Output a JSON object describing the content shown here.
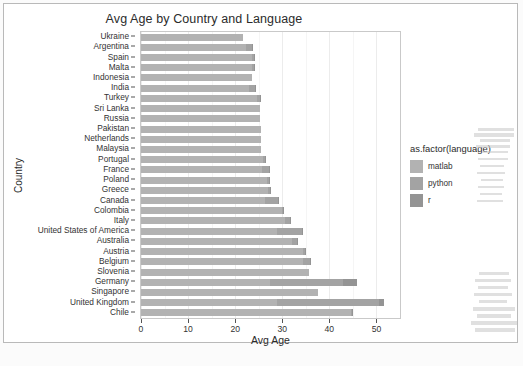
{
  "chart_data": {
    "type": "bar",
    "orientation": "horizontal",
    "stacked": true,
    "title": "Avg Age by Country and Language",
    "xlabel": "Avg Age",
    "ylabel": "Country",
    "xlim": [
      0,
      55
    ],
    "xticks": [
      0,
      10,
      20,
      30,
      40,
      50
    ],
    "xtick_labels": [
      "0",
      "10",
      "20",
      "30",
      "40",
      "50"
    ],
    "grid": true,
    "legend_title": "as.factor(language)",
    "legend_position": "right",
    "categories": [
      "Ukraine",
      "Argentina",
      "Spain",
      "Malta",
      "Indonesia",
      "India",
      "Turkey",
      "Sri Lanka",
      "Russia",
      "Pakistan",
      "Netherlands",
      "Malaysia",
      "Portugal",
      "France",
      "Poland",
      "Greece",
      "Canada",
      "Colombia",
      "Italy",
      "United States of America",
      "Australia",
      "Austria",
      "Belgium",
      "Slovenia",
      "Germany",
      "Singapore",
      "United Kingdom",
      "Chile"
    ],
    "series": [
      {
        "name": "matlab",
        "color": "#b2b2b2",
        "values": [
          21.6,
          22.2,
          23.5,
          23.5,
          23.6,
          23.0,
          24.6,
          25.3,
          25.3,
          25.4,
          25.5,
          25.4,
          26.0,
          25.6,
          26.8,
          27.0,
          26.4,
          29.9,
          30.5,
          28.9,
          32.0,
          34.4,
          34.4,
          35.6,
          27.4,
          37.6,
          28.8,
          44.6
        ]
      },
      {
        "name": "python",
        "color": "#a3a3a3",
        "values": [
          0.0,
          1.4,
          0.6,
          0.4,
          0.0,
          1.2,
          0.6,
          0.0,
          0.0,
          0.0,
          0.0,
          0.0,
          0.4,
          1.6,
          0.3,
          0.4,
          2.8,
          0.3,
          1.1,
          5.2,
          1.2,
          0.4,
          1.4,
          0.0,
          15.6,
          0.0,
          21.8,
          0.3
        ]
      },
      {
        "name": "r",
        "color": "#949494",
        "values": [
          0.0,
          0.1,
          0.1,
          0.1,
          0.0,
          0.1,
          0.1,
          0.0,
          0.0,
          0.0,
          0.0,
          0.0,
          0.1,
          0.1,
          0.1,
          0.1,
          0.1,
          0.1,
          0.1,
          0.1,
          0.1,
          0.1,
          0.1,
          0.0,
          2.8,
          0.0,
          1.1,
          0.1
        ]
      }
    ],
    "totals": [
      21.6,
      23.7,
      24.2,
      24.0,
      23.6,
      24.3,
      25.3,
      25.3,
      25.3,
      25.4,
      25.5,
      25.4,
      26.5,
      27.3,
      27.2,
      27.5,
      29.3,
      30.3,
      31.7,
      34.2,
      33.3,
      34.9,
      35.9,
      35.6,
      45.8,
      37.6,
      51.7,
      45.0
    ]
  },
  "legend": {
    "title": "as.factor(language)",
    "entries": [
      {
        "label": "matlab",
        "key": "matlab-swatch"
      },
      {
        "label": "python",
        "key": "python-swatch"
      },
      {
        "label": "r",
        "key": "r-swatch"
      }
    ]
  },
  "axes": {
    "x": {
      "title": "Avg Age",
      "ticks": [
        "0",
        "10",
        "20",
        "30",
        "40",
        "50"
      ]
    },
    "y": {
      "title": "Country"
    }
  }
}
